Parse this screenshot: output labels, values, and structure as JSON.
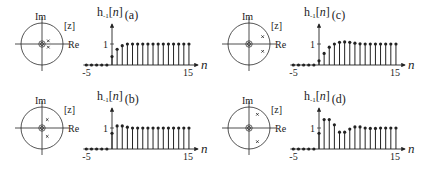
{
  "figure": {
    "title_template": "h-1[n]",
    "im_label": "Im",
    "re_label": "Re",
    "z_label": "[z]",
    "n_label": "n",
    "y_tick_label": "1",
    "x_tick_left": "-5",
    "x_tick_right": "15",
    "colors": {
      "ink": "#222222",
      "circle": "#555555",
      "background": "#ffffff"
    }
  },
  "chart_data": [
    {
      "type": "stem",
      "panel": "a",
      "title": "h-1[n] (a)",
      "xlabel": "n",
      "ylabel": "h-1[n]",
      "xlim": [
        -5,
        15
      ],
      "x_ticks": [
        -5,
        15
      ],
      "y_ticks": [
        1
      ],
      "x": [
        -5,
        -4,
        -3,
        -2,
        -1,
        0,
        1,
        2,
        3,
        4,
        5,
        6,
        7,
        8,
        9,
        10,
        11,
        12,
        13,
        14,
        15
      ],
      "values": [
        0,
        0,
        0,
        0,
        0,
        0.4,
        0.75,
        0.92,
        1,
        1,
        1,
        1,
        1,
        1,
        1,
        1,
        1,
        1,
        1,
        1,
        1
      ],
      "pole_zero": {
        "zeros": [
          [
            0,
            0
          ],
          [
            0,
            0
          ]
        ],
        "poles": [
          [
            0.3,
            0.15
          ],
          [
            0.3,
            -0.15
          ]
        ],
        "unit_circle": true
      }
    },
    {
      "type": "stem",
      "panel": "b",
      "title": "h-1[n] (b)",
      "xlabel": "n",
      "ylabel": "h-1[n]",
      "xlim": [
        -5,
        15
      ],
      "x_ticks": [
        -5,
        15
      ],
      "y_ticks": [
        1
      ],
      "x": [
        -5,
        -4,
        -3,
        -2,
        -1,
        0,
        1,
        2,
        3,
        4,
        5,
        6,
        7,
        8,
        9,
        10,
        11,
        12,
        13,
        14,
        15
      ],
      "values": [
        0,
        0,
        0,
        0,
        0,
        0.75,
        1.1,
        1.1,
        1.04,
        1,
        1,
        1,
        1,
        1,
        1,
        1,
        1,
        1,
        1,
        1,
        1
      ],
      "pole_zero": {
        "zeros": [
          [
            0,
            0
          ],
          [
            0,
            0
          ]
        ],
        "poles": [
          [
            0.25,
            0.4
          ],
          [
            0.25,
            -0.4
          ]
        ],
        "unit_circle": true
      }
    },
    {
      "type": "stem",
      "panel": "c",
      "title": "h-1[n] (c)",
      "xlabel": "n",
      "ylabel": "h-1[n]",
      "xlim": [
        -5,
        15
      ],
      "x_ticks": [
        -5,
        15
      ],
      "y_ticks": [
        1
      ],
      "x": [
        -5,
        -4,
        -3,
        -2,
        -1,
        0,
        1,
        2,
        3,
        4,
        5,
        6,
        7,
        8,
        9,
        10,
        11,
        12,
        13,
        14,
        15
      ],
      "values": [
        0,
        0,
        0,
        0,
        0,
        0.2,
        0.55,
        0.85,
        1,
        1.08,
        1.1,
        1.08,
        1.04,
        1.01,
        1,
        1,
        1,
        1,
        1,
        1,
        1
      ],
      "pole_zero": {
        "zeros": [
          [
            0,
            0
          ],
          [
            0,
            0
          ]
        ],
        "poles": [
          [
            0.65,
            0.35
          ],
          [
            0.65,
            -0.35
          ]
        ],
        "unit_circle": true
      }
    },
    {
      "type": "stem",
      "panel": "d",
      "title": "h-1[n] (d)",
      "xlabel": "n",
      "ylabel": "h-1[n]",
      "xlim": [
        -5,
        15
      ],
      "x_ticks": [
        -5,
        15
      ],
      "y_ticks": [
        1
      ],
      "x": [
        -5,
        -4,
        -3,
        -2,
        -1,
        0,
        1,
        2,
        3,
        4,
        5,
        6,
        7,
        8,
        9,
        10,
        11,
        12,
        13,
        14,
        15
      ],
      "values": [
        0,
        0,
        0,
        0,
        0,
        0.75,
        1.4,
        1.4,
        1.15,
        0.8,
        0.8,
        0.95,
        1.05,
        1.05,
        1,
        0.98,
        0.98,
        1,
        1,
        1,
        1
      ],
      "pole_zero": {
        "zeros": [
          [
            0,
            0
          ],
          [
            0,
            0
          ]
        ],
        "poles": [
          [
            0.4,
            0.65
          ],
          [
            0.4,
            -0.65
          ]
        ],
        "unit_circle": true
      }
    }
  ],
  "layout": {
    "panels": [
      {
        "id": "a",
        "ox": 0,
        "oy": 0
      },
      {
        "id": "c",
        "ox": 207,
        "oy": 0
      },
      {
        "id": "b",
        "ox": 0,
        "oy": 84
      },
      {
        "id": "d",
        "ox": 207,
        "oy": 84
      }
    ]
  }
}
